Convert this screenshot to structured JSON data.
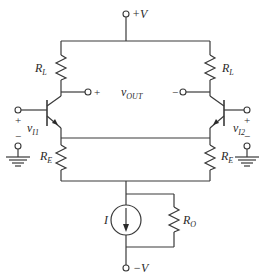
{
  "diagram": {
    "type": "differential-amplifier-circuit",
    "supply": {
      "positive": "+V",
      "negative": "−V"
    },
    "load_resistors": [
      {
        "main": "R",
        "sub": "L"
      },
      {
        "main": "R",
        "sub": "L"
      }
    ],
    "emitter_resistors": [
      {
        "main": "R",
        "sub": "E"
      },
      {
        "main": "R",
        "sub": "E"
      }
    ],
    "output": {
      "main": "v",
      "sub": "OUT",
      "plus": "+",
      "minus": "−"
    },
    "inputs": [
      {
        "main": "v",
        "sub": "I1",
        "plus": "+",
        "minus": "−"
      },
      {
        "main": "v",
        "sub": "I2",
        "plus": "+",
        "minus": "−"
      }
    ],
    "current_source": {
      "label": "I"
    },
    "output_resistance": {
      "main": "R",
      "sub": "O"
    },
    "colors": {
      "wire": "#3a3a3a",
      "text": "#2a2a2a",
      "background": "#ffffff"
    }
  }
}
